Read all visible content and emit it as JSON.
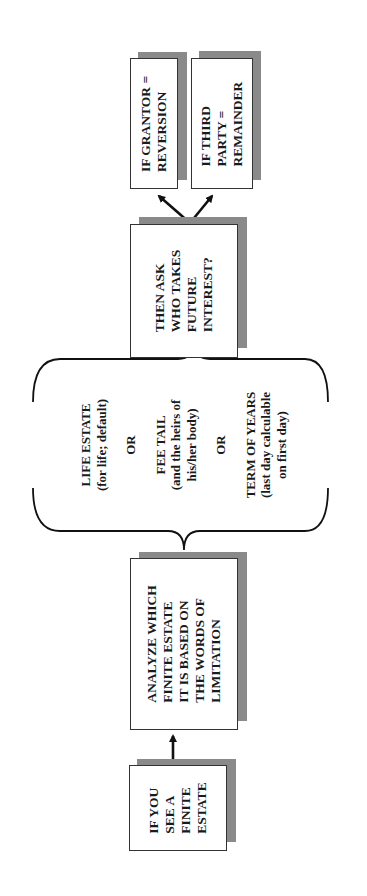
{
  "diagram": {
    "orientation": "rotated-90-ccw",
    "nodes": {
      "start": {
        "lines": [
          "IF YOU",
          "SEE A",
          "FINITE",
          "ESTATE"
        ]
      },
      "analyze": {
        "lines": [
          "ANALYZE WHICH",
          "FINITE ESTATE",
          "IT IS BASED ON",
          "THE WORDS OF",
          "LIMITATION"
        ]
      },
      "options": {
        "life_estate": [
          "LIFE ESTATE",
          "(for life; default)"
        ],
        "or_1": "OR",
        "fee_tail": [
          "FEE TAIL",
          "(and the heirs of",
          "his/her body)"
        ],
        "or_2": "OR",
        "term_of_years": [
          "TERM OF YEARS",
          "(last day calculable",
          "on first day)"
        ]
      },
      "ask": {
        "lines": [
          "THEN ASK",
          "WHO TAKES",
          "FUTURE",
          "INTEREST?"
        ]
      },
      "grantor": {
        "lines": [
          "IF GRANTOR =",
          "REVERSION"
        ]
      },
      "third_party": {
        "lines": [
          "IF THIRD",
          "PARTY =",
          "REMAINDER"
        ]
      }
    },
    "edges": [
      {
        "from": "start",
        "to": "analyze",
        "type": "arrow"
      },
      {
        "from": "analyze",
        "to": "options",
        "type": "brace"
      },
      {
        "from": "options",
        "to": "ask",
        "type": "brace"
      },
      {
        "from": "ask",
        "to": "grantor",
        "type": "arrow"
      },
      {
        "from": "ask",
        "to": "third_party",
        "type": "arrow"
      }
    ],
    "colors": {
      "shadow": "#8a8a8a",
      "border": "#333333",
      "text": "#1a1a1a",
      "background": "#ffffff"
    }
  }
}
